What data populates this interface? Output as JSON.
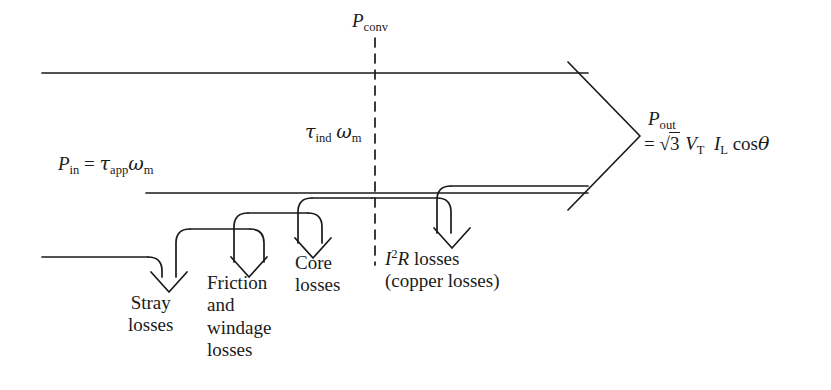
{
  "diagram": {
    "name": "induction-machine-power-flow-diagram",
    "type": "power-flow",
    "background_color": "#ffffff",
    "line_color": "#1a1a1a",
    "input": {
      "symbol": "P",
      "symbol_sub": "in",
      "equals": "=",
      "torque_symbol": "τ",
      "torque_sub": "app",
      "speed_symbol": "ω",
      "speed_sub": "m"
    },
    "converted": {
      "symbol": "P",
      "symbol_sub": "conv",
      "divider_style": "dashed"
    },
    "air_gap": {
      "torque_symbol": "τ",
      "torque_sub": "ind",
      "speed_symbol": "ω",
      "speed_sub": "m"
    },
    "output": {
      "symbol": "P",
      "symbol_sub": "out",
      "equals": "=",
      "radical_sign": "√",
      "radicand": "3",
      "voltage_symbol": "V",
      "voltage_sub": "T",
      "current_symbol": "I",
      "current_sub": "L",
      "cos": "cos",
      "angle": "θ"
    },
    "losses": [
      {
        "id": "stray",
        "lines": [
          "Stray",
          "losses"
        ]
      },
      {
        "id": "friction-windage",
        "lines": [
          "Friction",
          "and",
          "windage",
          "losses"
        ]
      },
      {
        "id": "core",
        "lines": [
          "Core",
          "losses"
        ]
      },
      {
        "id": "copper",
        "symbol": "I",
        "exponent": "2",
        "resistance": "R",
        "word": "losses",
        "lines": [
          "(copper losses)"
        ]
      }
    ]
  }
}
